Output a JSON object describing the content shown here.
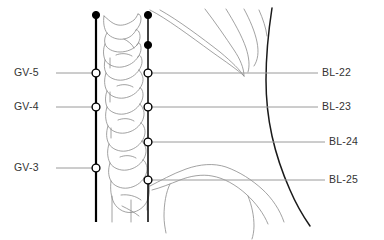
{
  "figure": {
    "width": 384,
    "height": 240,
    "background": "#ffffff"
  },
  "colors": {
    "label_text": "#333333",
    "leader_line": "#9a9a9a",
    "meridian_line": "#000000",
    "bone_outline": "#8a8a8a",
    "body_contour": "#1a1a1a",
    "point_fill_open": "#ffffff",
    "point_fill_closed": "#000000"
  },
  "meridians": [
    {
      "name": "governing-vessel",
      "abbr": "GV",
      "x": 96,
      "y_top": 15,
      "y_bottom": 222,
      "stroke_width": 2.2
    },
    {
      "name": "bladder-meridian",
      "abbr": "BL",
      "x": 148,
      "y_top": 15,
      "y_bottom": 222,
      "stroke_width": 1.5
    }
  ],
  "left_labels": [
    {
      "id": "gv-5",
      "text": "GV-5",
      "text_x": 14,
      "text_y": 76,
      "point_x": 96,
      "point_y": 73,
      "leader_x1": 56,
      "leader_x2": 94
    },
    {
      "id": "gv-4",
      "text": "GV-4",
      "text_x": 14,
      "text_y": 110,
      "point_x": 96,
      "point_y": 107,
      "leader_x1": 56,
      "leader_x2": 94
    },
    {
      "id": "gv-3",
      "text": "GV-3",
      "text_x": 14,
      "text_y": 171,
      "point_x": 96,
      "point_y": 168,
      "leader_x1": 56,
      "leader_x2": 94
    }
  ],
  "right_labels": [
    {
      "id": "bl-22",
      "text": "BL-22",
      "text_x": 322,
      "text_y": 76,
      "point_x": 148,
      "point_y": 73,
      "leader_x1": 150,
      "leader_x2": 318
    },
    {
      "id": "bl-23",
      "text": "BL-23",
      "text_x": 322,
      "text_y": 110,
      "point_x": 148,
      "point_y": 107,
      "leader_x1": 150,
      "leader_x2": 318
    },
    {
      "id": "bl-24",
      "text": "BL-24",
      "text_x": 329,
      "text_y": 145,
      "point_x": 148,
      "point_y": 142,
      "leader_x1": 150,
      "leader_x2": 325
    },
    {
      "id": "bl-25",
      "text": "BL-25",
      "text_x": 329,
      "text_y": 183,
      "point_x": 148,
      "point_y": 180,
      "leader_x1": 150,
      "leader_x2": 325
    }
  ],
  "marker_points": [
    {
      "id": "gv-top-marker",
      "type": "filled",
      "x": 96,
      "y": 15,
      "r": 3.6
    },
    {
      "id": "bl-top-marker",
      "type": "filled",
      "x": 148,
      "y": 15,
      "r": 3.6
    },
    {
      "id": "bl-second-marker",
      "type": "filled",
      "x": 148,
      "y": 45,
      "r": 3.6
    },
    {
      "id": "gv-5-point",
      "type": "open",
      "x": 96,
      "y": 73,
      "r": 3.9
    },
    {
      "id": "gv-4-point",
      "type": "open",
      "x": 96,
      "y": 107,
      "r": 3.9
    },
    {
      "id": "gv-3-point",
      "type": "open",
      "x": 96,
      "y": 168,
      "r": 3.9
    },
    {
      "id": "bl-22-point",
      "type": "open",
      "x": 148,
      "y": 73,
      "r": 3.9
    },
    {
      "id": "bl-23-point",
      "type": "open",
      "x": 148,
      "y": 107,
      "r": 3.9
    },
    {
      "id": "bl-24-point",
      "type": "open",
      "x": 148,
      "y": 142,
      "r": 3.9
    },
    {
      "id": "bl-25-point",
      "type": "open",
      "x": 148,
      "y": 180,
      "r": 3.9
    }
  ],
  "anatomy": {
    "vertebrae_label": "lumbar-vertebrae-lateral-view",
    "ribs_label": "lower-rib-cage-outline",
    "pelvis_label": "iliac-crest-outline",
    "contour_label": "posterior-body-contour"
  }
}
